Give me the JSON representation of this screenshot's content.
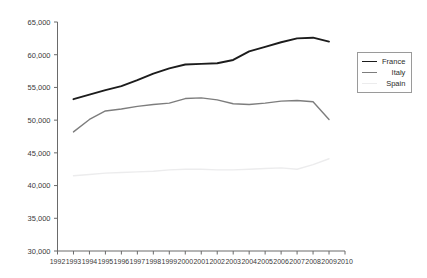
{
  "chart_data": {
    "type": "line",
    "title": "",
    "subtitle": "",
    "xlabel": "",
    "ylabel": "",
    "xlim": [
      1992,
      2010
    ],
    "ylim": [
      30000,
      65000
    ],
    "grid": false,
    "legend_position": "top-right",
    "x": [
      1993,
      1994,
      1995,
      1996,
      1997,
      1998,
      1999,
      2000,
      2001,
      2002,
      2003,
      2004,
      2005,
      2006,
      2007,
      2008,
      2009
    ],
    "xticks": [
      "1992",
      "1993",
      "1994",
      "1995",
      "1996",
      "1997",
      "1998",
      "1999",
      "2000",
      "2001",
      "2002",
      "2003",
      "2004",
      "2005",
      "2006",
      "2007",
      "2008",
      "2009",
      "2010"
    ],
    "yticks": [
      "30,000",
      "35,000",
      "40,000",
      "45,000",
      "50,000",
      "55,000",
      "60,000",
      "65,000"
    ],
    "ytick_values": [
      30000,
      35000,
      40000,
      45000,
      50000,
      55000,
      60000,
      65000
    ],
    "series": [
      {
        "name": "France",
        "color": "#1c1c1c",
        "width": 1.9,
        "values": [
          53200,
          53900,
          54600,
          55200,
          56100,
          57100,
          57900,
          58500,
          58600,
          58700,
          59200,
          60500,
          61200,
          61900,
          62500,
          62600,
          62000
        ]
      },
      {
        "name": "Italy",
        "color": "#7d7d7d",
        "width": 1.4,
        "values": [
          48200,
          50100,
          51400,
          51700,
          52100,
          52400,
          52600,
          53300,
          53400,
          53100,
          52500,
          52400,
          52600,
          52900,
          53000,
          52800,
          50100
        ]
      },
      {
        "name": "Spain",
        "color": "#ececed",
        "width": 1.4,
        "values": [
          41500,
          41700,
          41900,
          42000,
          42100,
          42200,
          42400,
          42500,
          42500,
          42400,
          42400,
          42500,
          42600,
          42700,
          42500,
          43200,
          44100
        ]
      }
    ]
  },
  "legend": {
    "entries": [
      {
        "label": "France"
      },
      {
        "label": "Italy"
      },
      {
        "label": "Spain"
      }
    ]
  }
}
